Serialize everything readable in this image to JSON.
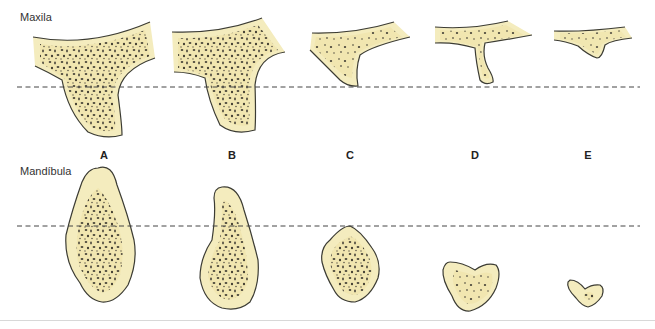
{
  "labels": {
    "maxila": "Maxila",
    "mandibula": "Mandíbula"
  },
  "columns": [
    {
      "id": "A",
      "label": "A",
      "x": 104
    },
    {
      "id": "B",
      "label": "B",
      "x": 232
    },
    {
      "id": "C",
      "label": "C",
      "x": 350
    },
    {
      "id": "D",
      "label": "D",
      "x": 475
    },
    {
      "id": "E",
      "label": "E",
      "x": 588
    }
  ],
  "colors": {
    "bone_fill": "#f4ecbe",
    "outline": "#3c3c34",
    "trabecular": "#4a463a",
    "dashed_line": "#444444"
  },
  "reference_lines": {
    "maxila_y": 87,
    "mandibula_y": 226
  }
}
